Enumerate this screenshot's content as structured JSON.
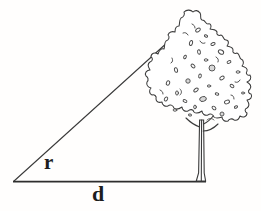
{
  "figure": {
    "type": "geometry-diagram",
    "background_color": "#fffefd",
    "line_color": "#3b3b3b",
    "width": 261,
    "height": 211
  },
  "labels": {
    "angle_label": "r",
    "base_label": "d"
  },
  "geometry": {
    "apex": {
      "x": 200,
      "y": 13
    },
    "left_vertex": {
      "x": 13,
      "y": 182
    },
    "right_vertex": {
      "x": 205,
      "y": 182
    },
    "hypotenuse": "from left vertex to apex",
    "baseline": "from left vertex to tree base"
  },
  "tree": {
    "name": "deciduous-tree",
    "crown_top": {
      "x": 200,
      "y": 13
    },
    "crown_left": {
      "x": 155,
      "y": 118
    },
    "crown_right": {
      "x": 252,
      "y": 118
    },
    "trunk_top": {
      "x": 201,
      "y": 128
    },
    "trunk_base": {
      "x": 203,
      "y": 182
    }
  }
}
